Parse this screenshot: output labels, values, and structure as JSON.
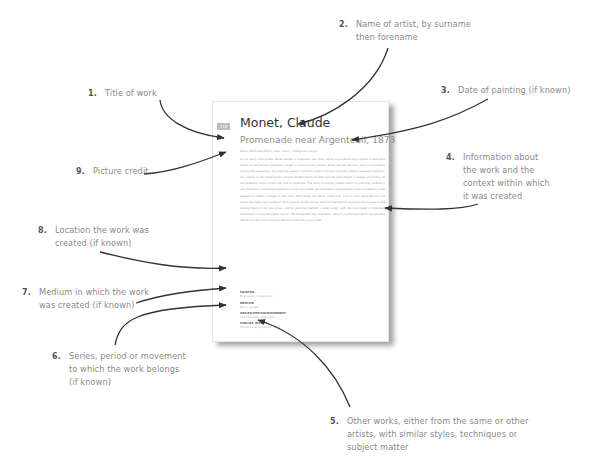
{
  "page": {
    "page_number": "118",
    "artist": "Monet, Claude",
    "title": "Promenade near Argenteuil, 1873",
    "picture_credit": "Musée Marmottan Monet, Paris, France / Bridgeman Images",
    "body": "On his return from London Monet settled in Argenteuil, near Paris, which was experiencing a period of enormous growth as the Parisian population sought to move to the suburbs. Monet painted the town and its surrounding countryside extensively, documenting aspects of different times of the day and under different weather conditions. Any aspects of the modernisation process he depicted he handled with the same delight in energy and fluidity. He was especially drawn to the river and its landscape. The family is strongly present within his paintings, whether it was the family in the endless garden or in the countryside. He conceived a quiet glimpse of light and fleeting, quiet absence of modern changes of the times. Both Sisley and Renoir made brief visits to work alongside him and Manet also spent the summer of 1874 painting nearby. During 1873 and 1874 Monet enjoyed great success as the leading figure of the new group, and his paintings reached a wider public, with the countryside of Argenteuil remaining his favoured subject matter. The Promenade near Argenteuil, 1873, is a good example of this peaceful theme with the artist's family at leisure in the sunny countryside.",
    "meta": [
      {
        "label": "PAINTED",
        "value": "Boulevard, nr Argenteuil"
      },
      {
        "label": "MEDIUM",
        "value": "Oil on canvas"
      },
      {
        "label": "SERIES/PERIOD/MOVEMENT",
        "value": "Impressionism, Argenteuil"
      },
      {
        "label": "SIMILAR WORKS",
        "value": "The Seine at Argenteuil, 1873"
      }
    ]
  },
  "callouts": [
    {
      "num": "1.",
      "lines": [
        "Title of work"
      ]
    },
    {
      "num": "2.",
      "lines": [
        "Name of artist, by surname",
        "then forename"
      ]
    },
    {
      "num": "3.",
      "lines": [
        "Date of painting (if known)"
      ]
    },
    {
      "num": "4.",
      "lines": [
        "Information about",
        "the work and the",
        "context within which",
        "it was created"
      ]
    },
    {
      "num": "5.",
      "lines": [
        "Other works, either from the same or other",
        "artists, with similar styles, techniques or",
        "subject matter"
      ]
    },
    {
      "num": "6.",
      "lines": [
        "Series, period or movement",
        "to which the work belongs",
        "(if known)"
      ]
    },
    {
      "num": "7.",
      "lines": [
        "Medium in which the work",
        "was created (if known)"
      ]
    },
    {
      "num": "8.",
      "lines": [
        "Location the work was",
        "created (if known)"
      ]
    },
    {
      "num": "9.",
      "lines": [
        "Picture credit"
      ]
    }
  ]
}
